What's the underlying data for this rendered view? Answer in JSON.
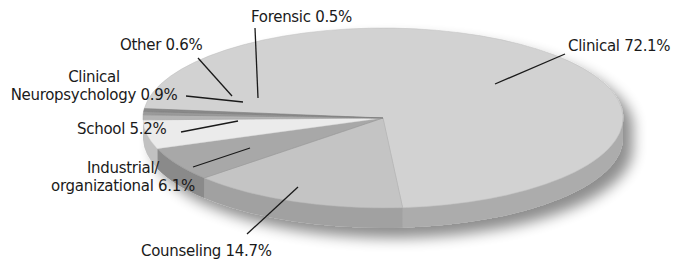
{
  "chart_data": {
    "type": "pie",
    "style": "3d-tilted",
    "title": "",
    "categories": [
      "Clinical",
      "Counseling",
      "Industrial/organizational",
      "School",
      "Clinical Neuropsychology",
      "Other",
      "Forensic"
    ],
    "values": [
      72.1,
      14.7,
      6.1,
      5.2,
      0.9,
      0.6,
      0.5
    ],
    "unit": "%",
    "labels": [
      {
        "id": "clinical",
        "line1": "Clinical 72.1%"
      },
      {
        "id": "counseling",
        "line1": "Counseling 14.7%"
      },
      {
        "id": "industrial",
        "line1": "Industrial/",
        "line2": "organizational 6.1%"
      },
      {
        "id": "school",
        "line1": "School 5.2%"
      },
      {
        "id": "neuro",
        "line1": "Clinical",
        "line2": "Neuropsychology 0.9%"
      },
      {
        "id": "other",
        "line1": "Other 0.6%"
      },
      {
        "id": "forensic",
        "line1": "Forensic 0.5%"
      }
    ],
    "colors": {
      "Clinical": "#d2d2d2",
      "Counseling": "#c4c4c4",
      "Industrial/organizational": "#a8a8a8",
      "School": "#ebebeb",
      "Clinical Neuropsychology": "#b4b4b4",
      "Other": "#9a9a9a",
      "Forensic": "#8a8a8a"
    },
    "legend": "none (leader-line labels)",
    "grid": false
  }
}
